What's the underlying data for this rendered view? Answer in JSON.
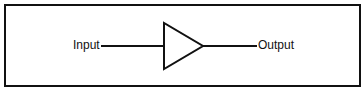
{
  "diagram": {
    "type": "block-diagram",
    "input_label": "Input",
    "output_label": "Output",
    "block_shape": "triangle-amplifier",
    "colors": {
      "stroke": "#111111",
      "background": "#ffffff"
    }
  }
}
